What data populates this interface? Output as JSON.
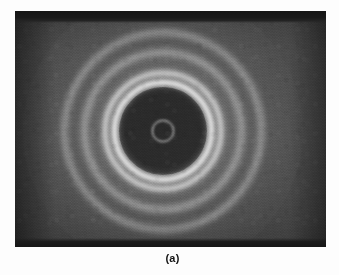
{
  "figure": {
    "caption": "(a)",
    "label_position": "below-image",
    "page_background": "#fdfdfd",
    "caption_color": "#141414"
  },
  "plate": {
    "name": "electron-diffraction-photograph",
    "description": "Debye-Scherrer ring diffraction pattern on photographic plate",
    "x": 15,
    "y": 11,
    "width": 311,
    "height": 236,
    "background_color": "#3f3f3f",
    "edge_strip_color": "#171717",
    "halo_color": "#d7d7d7"
  },
  "chart_data": {
    "type": "scatter",
    "title": "(a)",
    "subtitle": "",
    "xlabel": "",
    "ylabel": "",
    "grid": false,
    "legend": "none",
    "pattern": "concentric-diffraction-rings",
    "center": {
      "x": 163,
      "y": 131
    },
    "units": "pixels",
    "xlim": [
      15,
      326
    ],
    "ylim": [
      11,
      247
    ],
    "rings": [
      {
        "index": 1,
        "name": "central-aperture-ring",
        "radius": 9,
        "thickness": 1.6,
        "brightness": 0.9,
        "blur": 1.0
      },
      {
        "index": 2,
        "name": "first-strong-ring",
        "radius": 46,
        "thickness": 5.0,
        "brightness": 1.0,
        "blur": 2.0
      },
      {
        "index": 3,
        "name": "second-strong-ring",
        "radius": 56,
        "thickness": 4.0,
        "brightness": 0.94,
        "blur": 2.4
      },
      {
        "index": 4,
        "name": "third-ring",
        "radius": 77,
        "thickness": 3.2,
        "brightness": 0.7,
        "blur": 3.0
      },
      {
        "index": 5,
        "name": "fourth-ring",
        "radius": 97,
        "thickness": 3.0,
        "brightness": 0.62,
        "blur": 3.4
      }
    ],
    "ring_radii": [
      9,
      46,
      56,
      77,
      97
    ],
    "ring_relative_intensity": [
      0.9,
      1.0,
      0.94,
      0.7,
      0.62
    ],
    "central_disc": {
      "radius": 44,
      "relative_intensity": 0.12
    },
    "annotations": []
  }
}
